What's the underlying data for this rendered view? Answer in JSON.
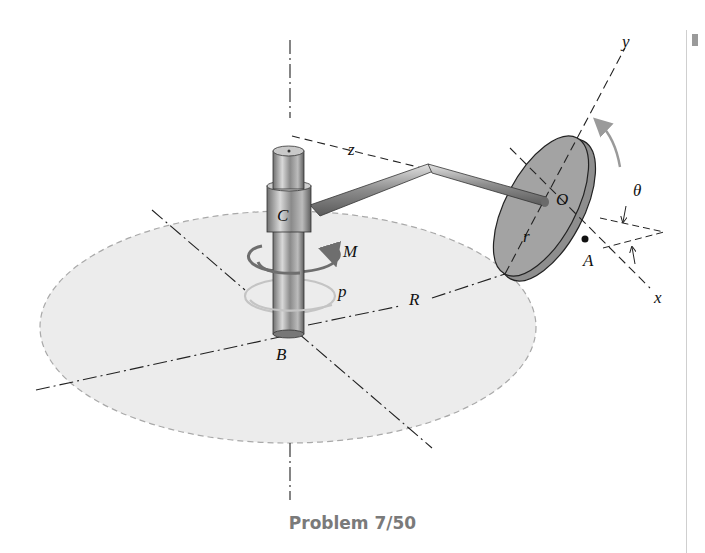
{
  "figure": {
    "caption": "Problem 7/50",
    "labels": {
      "y_axis": "y",
      "z_axis": "z",
      "x_axis": "x",
      "origin": "O",
      "theta": "θ",
      "point_A": "A",
      "point_C": "C",
      "point_B": "B",
      "moment": "M",
      "p_label": "p",
      "big_radius": "R",
      "disk_radius": "r"
    },
    "colors": {
      "ellipse_fill": "#ececec",
      "disk_fill": "#9b9b9b",
      "shaft_fill": "#a8a8a8",
      "moment_arrow": "#6e6e6e",
      "p_arrow": "#bdbdbd",
      "rotation_arrow": "#9a9a9a",
      "caption": "#7a7a7a"
    }
  }
}
